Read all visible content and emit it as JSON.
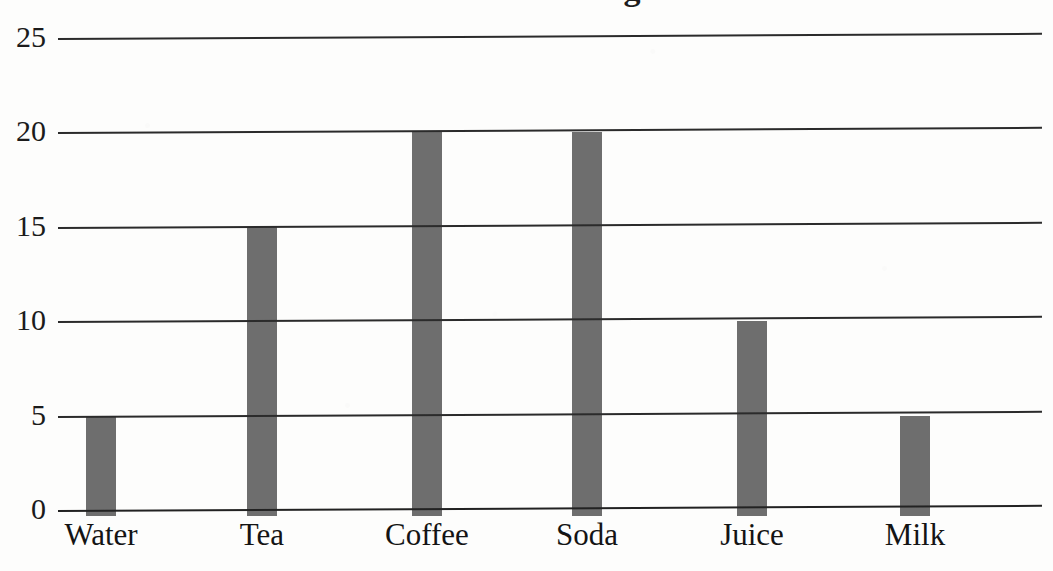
{
  "chart_data": {
    "type": "bar",
    "title": "Favorite Beverages",
    "title_visible": false,
    "xlabel": "",
    "ylabel": "",
    "categories": [
      "Water",
      "Tea",
      "Coffee",
      "Soda",
      "Juice",
      "Milk"
    ],
    "values": [
      5,
      15,
      20,
      20,
      10,
      5
    ],
    "series": [
      {
        "name": "Count",
        "values": [
          5,
          15,
          20,
          20,
          10,
          5
        ]
      }
    ],
    "ylim": [
      0,
      25
    ],
    "yticks": [
      0,
      5,
      10,
      15,
      20,
      25
    ],
    "ytick_labels": [
      "0",
      "5",
      "10",
      "15",
      "20",
      "25"
    ],
    "grid": true,
    "grid_axis": "y",
    "legend": false,
    "legend_position": "none",
    "bar_color": "#6e6e6e",
    "gridline_color": "#2b2b2b",
    "background_color": "#fdfdfc",
    "text_color": "#1b1b1b"
  },
  "axis": {
    "y_ticks": [
      {
        "label": "25",
        "value": 25
      },
      {
        "label": "20",
        "value": 20
      },
      {
        "label": "15",
        "value": 15
      },
      {
        "label": "10",
        "value": 10
      },
      {
        "label": "5",
        "value": 5
      },
      {
        "label": "0",
        "value": 0
      }
    ],
    "x_ticks": [
      {
        "label": "Water"
      },
      {
        "label": "Tea"
      },
      {
        "label": "Coffee"
      },
      {
        "label": "Soda"
      },
      {
        "label": "Juice"
      },
      {
        "label": "Milk"
      }
    ]
  },
  "bars": [
    {
      "category": "Water",
      "value": 5
    },
    {
      "category": "Tea",
      "value": 15
    },
    {
      "category": "Coffee",
      "value": 20
    },
    {
      "category": "Soda",
      "value": 20
    },
    {
      "category": "Juice",
      "value": 10
    },
    {
      "category": "Milk",
      "value": 5
    }
  ]
}
